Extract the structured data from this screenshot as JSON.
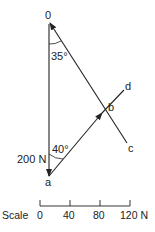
{
  "diagram": {
    "type": "force vector diagram",
    "points": {
      "o": {
        "label": "0"
      },
      "a": {
        "label": "a"
      },
      "b": {
        "label": "b"
      },
      "c": {
        "label": "c"
      },
      "d": {
        "label": "d"
      }
    },
    "angles": {
      "top": "35°",
      "bottom": "40°"
    },
    "force_label": "200 N",
    "colors": {
      "line": "#222222",
      "background": "#ffffff"
    }
  },
  "scale": {
    "title": "Scale",
    "ticks": [
      "0",
      "40",
      "80",
      "120 N"
    ]
  }
}
